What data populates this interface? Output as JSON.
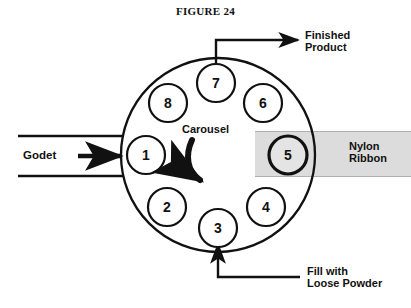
{
  "figure": {
    "title": "FIGURE 24",
    "width": 411,
    "height": 308
  },
  "colors": {
    "stroke": "#111111",
    "ribbon_fill": "#dcdcdc",
    "ribbon_edge": "#b8b8b8",
    "background": "#ffffff",
    "station_fill": "#ffffff"
  },
  "carousel": {
    "label": "Carousel",
    "rotation_direction": "clockwise",
    "center": {
      "x": 218,
      "y": 155
    },
    "radius": 97,
    "station_radius": 19,
    "stations": [
      {
        "id": 1,
        "label": "1",
        "x": 146,
        "y": 155,
        "highlighted": false
      },
      {
        "id": 2,
        "label": "2",
        "x": 167,
        "y": 207,
        "highlighted": false
      },
      {
        "id": 3,
        "label": "3",
        "x": 218,
        "y": 228,
        "highlighted": false
      },
      {
        "id": 4,
        "label": "4",
        "x": 266,
        "y": 207,
        "highlighted": false
      },
      {
        "id": 5,
        "label": "5",
        "x": 288,
        "y": 155,
        "highlighted": true
      },
      {
        "id": 6,
        "label": "6",
        "x": 263,
        "y": 103,
        "highlighted": false
      },
      {
        "id": 7,
        "label": "7",
        "x": 216,
        "y": 83,
        "highlighted": false
      },
      {
        "id": 8,
        "label": "8",
        "x": 168,
        "y": 103,
        "highlighted": false
      }
    ]
  },
  "inputs": {
    "godet": {
      "label": "Godet",
      "arrow_direction": "right",
      "guide_lines": [
        {
          "x1": 18,
          "y1": 136,
          "x2": 124,
          "y2": 136
        },
        {
          "x1": 18,
          "y1": 176,
          "x2": 124,
          "y2": 176
        }
      ]
    },
    "fill": {
      "label": "Fill with\nLoose Powder",
      "target_station": 3,
      "arrow_direction": "up"
    }
  },
  "outputs": {
    "finished_product": {
      "label": "Finished\nProduct",
      "source_station": 7,
      "arrow_direction": "right"
    },
    "nylon_ribbon": {
      "label": "Nylon\nRibbon",
      "station": 5,
      "band": {
        "x": 255,
        "y": 131,
        "width": 156,
        "height": 46
      }
    }
  }
}
